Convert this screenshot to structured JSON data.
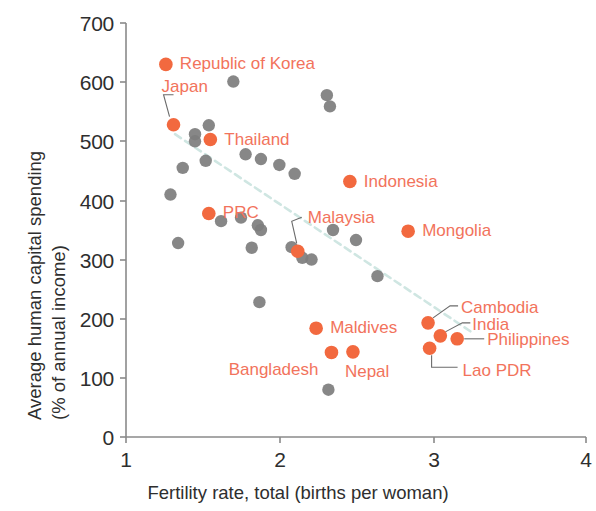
{
  "chart_data": {
    "type": "scatter",
    "title": "",
    "xlabel": "Fertility rate, total (births per woman)",
    "ylabel": "Average human capital spending\n(% of annual income)",
    "ylabel_line1": "Average human capital spending",
    "ylabel_line2": "(% of annual income)",
    "xlim": [
      1,
      4
    ],
    "ylim": [
      0,
      700
    ],
    "xticks": [
      "1",
      "2",
      "3",
      "4"
    ],
    "yticks": [
      "0",
      "100",
      "200",
      "300",
      "400",
      "500",
      "600",
      "700"
    ],
    "grid": false,
    "legend": "none",
    "colors": {
      "highlight": "#f2693f",
      "highlight_label": "#f2735c",
      "other": "#7d7d7d",
      "trendline": "#cfe6e2",
      "axis": "#8a8a8a",
      "text": "#2e2e2e"
    },
    "trendline": {
      "style": "dashed",
      "x": [
        1.32,
        3.25
      ],
      "y": [
        512,
        178
      ]
    },
    "series": [
      {
        "name": "Labeled economies",
        "color": "#f2693f",
        "points": [
          {
            "label": "Republic of Korea",
            "x": 1.26,
            "y": 630,
            "label_side": "right"
          },
          {
            "label": "Japan",
            "x": 1.31,
            "y": 528,
            "label_side": "leader-up"
          },
          {
            "label": "Thailand",
            "x": 1.55,
            "y": 503,
            "label_side": "right"
          },
          {
            "label": "PRC",
            "x": 1.54,
            "y": 378,
            "label_side": "right"
          },
          {
            "label": "Indonesia",
            "x": 2.46,
            "y": 432,
            "label_side": "right"
          },
          {
            "label": "Malaysia",
            "x": 2.12,
            "y": 314,
            "label_side": "leader-up"
          },
          {
            "label": "Mongolia",
            "x": 2.84,
            "y": 348,
            "label_side": "right"
          },
          {
            "label": "Maldives",
            "x": 2.24,
            "y": 184,
            "label_side": "right"
          },
          {
            "label": "Bangladesh",
            "x": 2.34,
            "y": 143,
            "label_side": "left"
          },
          {
            "label": "Nepal",
            "x": 2.48,
            "y": 144,
            "label_side": "below"
          },
          {
            "label": "Cambodia",
            "x": 2.97,
            "y": 193,
            "label_side": "leader-right"
          },
          {
            "label": "India",
            "x": 3.05,
            "y": 171,
            "label_side": "leader-right"
          },
          {
            "label": "Philippines",
            "x": 3.16,
            "y": 166,
            "label_side": "leader-right"
          },
          {
            "label": "Lao PDR",
            "x": 2.98,
            "y": 150,
            "label_side": "leader-right"
          }
        ]
      },
      {
        "name": "Other economies",
        "color": "#7d7d7d",
        "points": [
          {
            "x": 1.7,
            "y": 601
          },
          {
            "x": 2.31,
            "y": 578
          },
          {
            "x": 2.33,
            "y": 559
          },
          {
            "x": 1.54,
            "y": 527
          },
          {
            "x": 1.45,
            "y": 512
          },
          {
            "x": 1.45,
            "y": 500
          },
          {
            "x": 1.78,
            "y": 478
          },
          {
            "x": 1.88,
            "y": 470
          },
          {
            "x": 1.52,
            "y": 467
          },
          {
            "x": 2.0,
            "y": 460
          },
          {
            "x": 2.1,
            "y": 445
          },
          {
            "x": 1.37,
            "y": 455
          },
          {
            "x": 1.29,
            "y": 410
          },
          {
            "x": 1.75,
            "y": 371
          },
          {
            "x": 1.62,
            "y": 365
          },
          {
            "x": 1.86,
            "y": 358
          },
          {
            "x": 1.88,
            "y": 350
          },
          {
            "x": 2.35,
            "y": 350
          },
          {
            "x": 1.82,
            "y": 320
          },
          {
            "x": 2.5,
            "y": 333
          },
          {
            "x": 2.08,
            "y": 321
          },
          {
            "x": 2.15,
            "y": 303
          },
          {
            "x": 2.21,
            "y": 300
          },
          {
            "x": 1.34,
            "y": 328
          },
          {
            "x": 2.64,
            "y": 272
          },
          {
            "x": 1.87,
            "y": 228
          },
          {
            "x": 2.32,
            "y": 80
          }
        ]
      }
    ]
  },
  "axes": {
    "x_ticks": [
      {
        "label": "1",
        "px": 126
      },
      {
        "label": "2",
        "px": 280
      },
      {
        "label": "3",
        "px": 434
      },
      {
        "label": "4",
        "px": 586
      }
    ],
    "y_ticks": [
      {
        "label": "700",
        "px": 23
      },
      {
        "label": "600",
        "px": 82
      },
      {
        "label": "500",
        "px": 141
      },
      {
        "label": "400",
        "px": 201
      },
      {
        "label": "300",
        "px": 260
      },
      {
        "label": "200",
        "px": 319
      },
      {
        "label": "100",
        "px": 378
      },
      {
        "label": "0",
        "px": 437
      }
    ]
  }
}
